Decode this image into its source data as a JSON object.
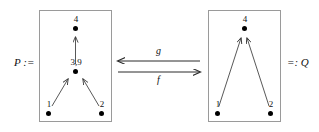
{
  "diagram": {
    "left_side_label": "P :=",
    "right_side_label": "=: Q",
    "arrow_top_label": "g",
    "arrow_bottom_label": "f",
    "colors": {
      "box_border": "#9a9a9a",
      "node": "#000000",
      "edge": "#3a3a3a",
      "text": "#111111",
      "background": "#ffffff"
    },
    "poset_p": {
      "name": "P",
      "nodes": [
        {
          "id": "p-top",
          "label": "4"
        },
        {
          "id": "p-mid",
          "label": "3,9"
        },
        {
          "id": "p-left",
          "label": "1"
        },
        {
          "id": "p-right",
          "label": "2"
        }
      ],
      "edges": [
        {
          "from": "p-mid",
          "to": "p-top"
        },
        {
          "from": "p-left",
          "to": "p-mid"
        },
        {
          "from": "p-right",
          "to": "p-mid"
        }
      ]
    },
    "poset_q": {
      "name": "Q",
      "nodes": [
        {
          "id": "q-top",
          "label": "4"
        },
        {
          "id": "q-left",
          "label": "1"
        },
        {
          "id": "q-right",
          "label": "2"
        }
      ],
      "edges": [
        {
          "from": "q-left",
          "to": "q-top"
        },
        {
          "from": "q-right",
          "to": "q-top"
        }
      ]
    }
  }
}
